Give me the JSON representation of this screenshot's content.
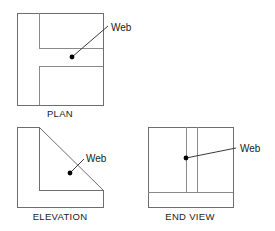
{
  "document": {
    "title": "Orthographic Projection — Web Feature",
    "background_color": "#ffffff",
    "line_color": "#6e6e6e",
    "inner_line_color": "#8a8a8a",
    "leader_color": "#3a3a3a",
    "text_color": "#1a1a1a",
    "width": 275,
    "height": 231
  },
  "views": {
    "plan": {
      "label": "PLAN",
      "label_x": 60,
      "label_y": 117,
      "outline": "M17,13 L103,13 L103,105 L17,105 Z",
      "inner_paths": [
        "M39,13 L39,48",
        "M39,48 L103,48",
        "M39,66 L103,66",
        "M39,66 L39,105"
      ],
      "callout": {
        "label": "Web",
        "label_x": 111,
        "label_y": 31,
        "dot_x": 72,
        "dot_y": 57,
        "dot_r": 2.4,
        "leader": "M72,57 L108,26"
      }
    },
    "elevation": {
      "label": "ELEVATION",
      "label_x": 60,
      "label_y": 220,
      "outline": "M17,127 L39,127 L39,190 L103,190 L103,207 L17,207 Z",
      "inner_paths": [],
      "diagonal": "M39,127 L103,190",
      "callout": {
        "label": "Web",
        "label_x": 86,
        "label_y": 162,
        "dot_x": 70,
        "dot_y": 173,
        "dot_r": 2.4,
        "leader": "M70,173 L84,159"
      }
    },
    "end_view": {
      "label": "END VIEW",
      "label_x": 190,
      "label_y": 220,
      "outline": "M148,127 L233,127 L233,207 L148,207 Z",
      "inner_paths": [
        "M186,127 L186,192",
        "M197,127 L197,192",
        "M148,192 L233,192"
      ],
      "callout": {
        "label": "Web",
        "label_x": 240,
        "label_y": 152,
        "dot_x": 186,
        "dot_y": 158,
        "dot_r": 2.4,
        "leader": "M186,158 L236,148"
      }
    }
  }
}
